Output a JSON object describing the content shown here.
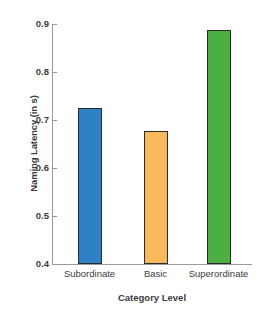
{
  "chart_data": {
    "type": "bar",
    "title": "",
    "categories": [
      "Subordinate",
      "Basic",
      "Superordinate"
    ],
    "values": [
      0.725,
      0.678,
      0.888
    ],
    "series": [
      {
        "name": "Naming Latency",
        "values": [
          0.725,
          0.678,
          0.888
        ]
      }
    ],
    "xlabel": "Category Level",
    "ylabel": "Naming Latency (in s)",
    "ylim": [
      0.4,
      0.9
    ],
    "yticks": [
      "0.4",
      "0.5",
      "0.6",
      "0.7",
      "0.8",
      "0.9"
    ],
    "ytick_values": [
      0.4,
      0.5,
      0.6,
      0.7,
      0.8,
      0.9
    ],
    "grid": false,
    "legend": false,
    "legend_position": "none",
    "bar_colors": [
      "#2e81c7",
      "#f7b95c",
      "#4caf44"
    ],
    "bar_edge_color": "#2b2b2b",
    "axis_color": "#9a9a9a",
    "background": "#ffffff"
  }
}
